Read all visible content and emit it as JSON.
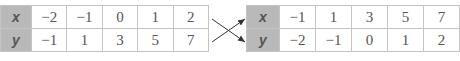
{
  "left_table": {
    "rows": [
      {
        "label": "x",
        "values": [
          "−2",
          "−1",
          "0",
          "1",
          "2"
        ]
      },
      {
        "label": "y",
        "values": [
          "−1",
          "1",
          "3",
          "5",
          "7"
        ]
      }
    ]
  },
  "right_table": {
    "rows": [
      {
        "label": "x",
        "values": [
          "−1",
          "1",
          "3",
          "5",
          "7"
        ]
      },
      {
        "label": "y",
        "values": [
          "−2",
          "−1",
          "0",
          "1",
          "2"
        ]
      }
    ]
  },
  "colors": {
    "header_fill": "#b9b9b9",
    "border": "#c4c4c4",
    "text": "#555555",
    "arrow": "#333333"
  }
}
